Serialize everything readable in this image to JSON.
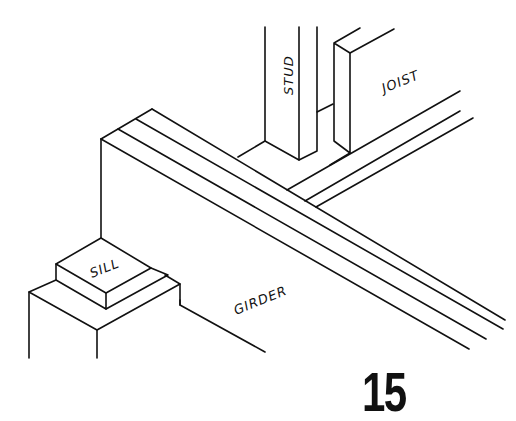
{
  "diagram": {
    "labels": {
      "stud": "STUD",
      "joist": "JOIST",
      "sill": "SILL",
      "girder": "GIRDER"
    },
    "page_number": "15"
  }
}
